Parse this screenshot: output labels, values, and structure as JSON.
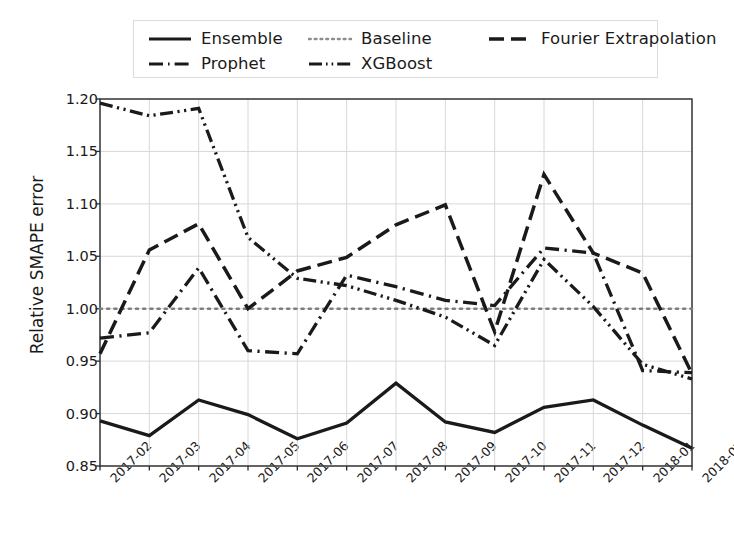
{
  "legend": {
    "entries": [
      {
        "label": "Ensemble",
        "style": "solid",
        "icon": "line-solid-icon"
      },
      {
        "label": "Baseline",
        "style": "dotted",
        "icon": "line-dotted-icon"
      },
      {
        "label": "Fourier Extrapolation",
        "style": "dashed",
        "icon": "line-dashed-icon"
      },
      {
        "label": "Prophet",
        "style": "dashdot",
        "icon": "line-dashdot-icon"
      },
      {
        "label": "XGBoost",
        "style": "dashdotdot",
        "icon": "line-dashdotdot-icon"
      }
    ]
  },
  "chart_data": {
    "type": "line",
    "title": "",
    "xlabel": "",
    "ylabel": "Relative SMAPE error",
    "categories": [
      "2017-02",
      "2017-03",
      "2017-04",
      "2017-05",
      "2017-06",
      "2017-07",
      "2017-08",
      "2017-09",
      "2017-10",
      "2017-11",
      "2017-12",
      "2018-01",
      "2018-02"
    ],
    "ylim": [
      0.85,
      1.2
    ],
    "yticks": [
      0.85,
      0.9,
      0.95,
      1.0,
      1.05,
      1.1,
      1.15,
      1.2
    ],
    "ytick_labels": [
      "0.85",
      "0.90",
      "0.95",
      "1.00",
      "1.05",
      "1.10",
      "1.15",
      "1.20"
    ],
    "grid": true,
    "legend_position": "upper-center-outside",
    "series": [
      {
        "name": "Ensemble",
        "style": "solid",
        "values": [
          0.893,
          0.879,
          0.913,
          0.899,
          0.876,
          0.891,
          0.929,
          0.892,
          0.882,
          0.906,
          0.913,
          0.889,
          0.867
        ]
      },
      {
        "name": "Baseline",
        "style": "dotted",
        "values": [
          1.0,
          1.0,
          1.0,
          1.0,
          1.0,
          1.0,
          1.0,
          1.0,
          1.0,
          1.0,
          1.0,
          1.0,
          1.0
        ]
      },
      {
        "name": "Fourier Extrapolation",
        "style": "dashed",
        "values": [
          0.957,
          1.056,
          1.081,
          1.0,
          1.036,
          1.049,
          1.08,
          1.099,
          0.978,
          1.128,
          1.053,
          1.034,
          0.938
        ]
      },
      {
        "name": "Prophet",
        "style": "dashdot",
        "values": [
          0.972,
          0.977,
          1.039,
          0.96,
          0.957,
          1.032,
          1.021,
          1.008,
          1.003,
          1.058,
          1.053,
          0.941,
          0.939
        ]
      },
      {
        "name": "XGBoost",
        "style": "dashdotdot",
        "values": [
          1.196,
          1.184,
          1.191,
          1.068,
          1.029,
          1.022,
          1.008,
          0.992,
          0.965,
          1.047,
          1.002,
          0.947,
          0.933
        ]
      }
    ]
  },
  "axes": {
    "ylabel": "Relative SMAPE error"
  }
}
